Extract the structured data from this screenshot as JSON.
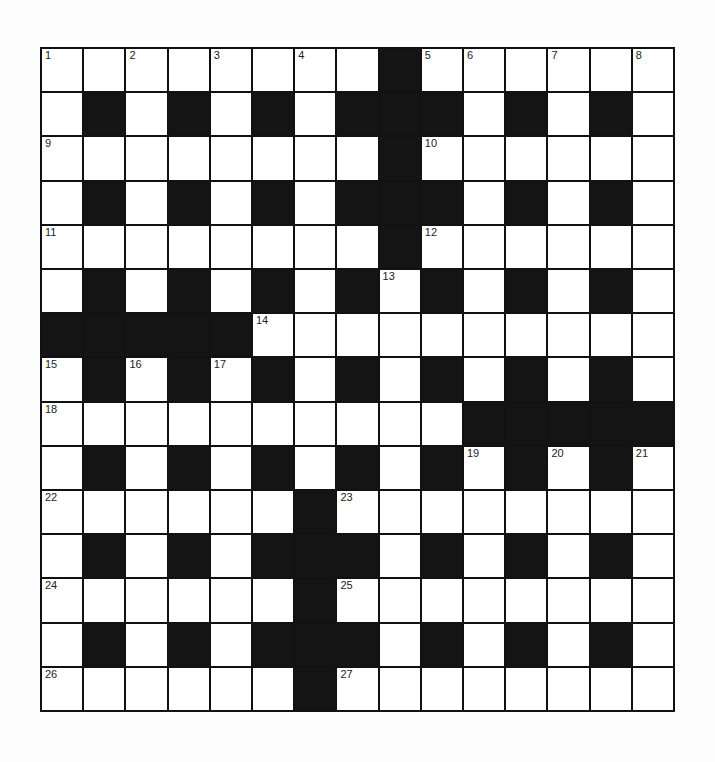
{
  "puzzle": {
    "rows": 15,
    "cols": 15,
    "grid": [
      "########.######",
      "#.#.#.#...#.#.#",
      "########.######",
      "#.#.#.#...#.#.#",
      "########.######",
      "#.#.#.#.#.#.#.#",
      ".....##########",
      "#.#.#.#.#.#.#.#",
      "##########.....",
      "#.#.#.#.#.#.#.#",
      "######.########",
      "#.#.#...#.#.#.#",
      "######.########",
      "#.#.#...#.#.#.#",
      "######.########"
    ],
    "grid_legend": {
      "#": "white",
      ".": "black"
    },
    "numbers": [
      {
        "n": "1",
        "r": 0,
        "c": 0
      },
      {
        "n": "2",
        "r": 0,
        "c": 2
      },
      {
        "n": "3",
        "r": 0,
        "c": 4
      },
      {
        "n": "4",
        "r": 0,
        "c": 6
      },
      {
        "n": "5",
        "r": 0,
        "c": 9
      },
      {
        "n": "6",
        "r": 0,
        "c": 10
      },
      {
        "n": "7",
        "r": 0,
        "c": 12
      },
      {
        "n": "8",
        "r": 0,
        "c": 14
      },
      {
        "n": "9",
        "r": 2,
        "c": 0
      },
      {
        "n": "10",
        "r": 2,
        "c": 9
      },
      {
        "n": "11",
        "r": 4,
        "c": 0
      },
      {
        "n": "12",
        "r": 4,
        "c": 9
      },
      {
        "n": "13",
        "r": 5,
        "c": 8
      },
      {
        "n": "14",
        "r": 6,
        "c": 5
      },
      {
        "n": "15",
        "r": 7,
        "c": 0
      },
      {
        "n": "16",
        "r": 7,
        "c": 2
      },
      {
        "n": "17",
        "r": 7,
        "c": 4
      },
      {
        "n": "18",
        "r": 8,
        "c": 0
      },
      {
        "n": "19",
        "r": 9,
        "c": 10
      },
      {
        "n": "20",
        "r": 9,
        "c": 12
      },
      {
        "n": "21",
        "r": 9,
        "c": 14
      },
      {
        "n": "22",
        "r": 10,
        "c": 0
      },
      {
        "n": "23",
        "r": 10,
        "c": 7
      },
      {
        "n": "24",
        "r": 12,
        "c": 0
      },
      {
        "n": "25",
        "r": 12,
        "c": 7
      },
      {
        "n": "26",
        "r": 14,
        "c": 0
      },
      {
        "n": "27",
        "r": 14,
        "c": 7
      }
    ]
  }
}
